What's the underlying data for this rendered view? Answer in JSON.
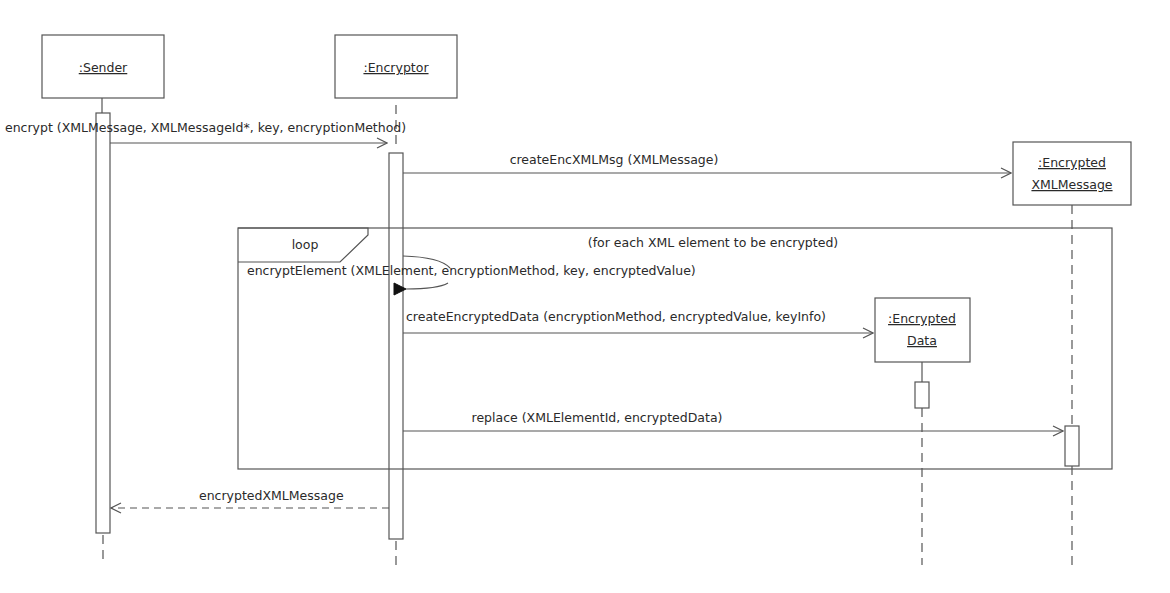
{
  "diagram": {
    "type": "UML sequence diagram",
    "lifelines": [
      {
        "id": "sender",
        "label": ":Sender"
      },
      {
        "id": "encryptor",
        "label": ":Encryptor"
      },
      {
        "id": "encrypted_xml_message",
        "label_line1": ":Encrypted",
        "label_line2": "XMLMessage"
      },
      {
        "id": "encrypted_data",
        "label_line1": ":Encrypted",
        "label_line2": "Data"
      }
    ],
    "loop": {
      "operator": "loop",
      "guard": "(for each XML element to be encrypted)"
    },
    "messages": [
      {
        "from": "sender",
        "to": "encryptor",
        "kind": "call",
        "label": "encrypt (XMLMessage, XMLMessageId*, key, encryptionMethod)"
      },
      {
        "from": "encryptor",
        "to": "encrypted_xml_message",
        "kind": "create",
        "label": "createEncXMLMsg (XMLMessage)"
      },
      {
        "from": "encryptor",
        "to": "encryptor",
        "kind": "self-call",
        "label": "encryptElement (XMLElement, encryptionMethod, key, encryptedValue)"
      },
      {
        "from": "encryptor",
        "to": "encrypted_data",
        "kind": "create",
        "label": "createEncryptedData (encryptionMethod, encryptedValue, keyInfo)"
      },
      {
        "from": "encryptor",
        "to": "encrypted_xml_message",
        "kind": "call",
        "label": "replace (XMLElementId, encryptedData)"
      },
      {
        "from": "encryptor",
        "to": "sender",
        "kind": "return",
        "label": "encryptedXMLMessage"
      }
    ]
  }
}
